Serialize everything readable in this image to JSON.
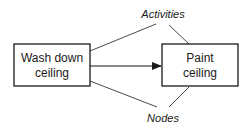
{
  "diagram": {
    "nodes": [
      {
        "id": "wash",
        "label_line1": "Wash down",
        "label_line2": "ceiling"
      },
      {
        "id": "paint",
        "label_line1": "Paint",
        "label_line2": "ceiling"
      }
    ],
    "edges": [
      {
        "from": "wash",
        "to": "paint",
        "type": "arrow"
      }
    ],
    "annotations": {
      "top": "Activities",
      "bottom": "Nodes"
    },
    "colors": {
      "stroke": "#1a1a1a",
      "background": "#ffffff"
    }
  }
}
